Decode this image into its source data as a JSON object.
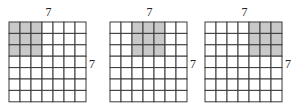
{
  "figures": [
    {
      "name": "grid-1",
      "rows": 7,
      "cols": 7,
      "top_label": "7",
      "side_label": "7",
      "shaded": {
        "row_start": 0,
        "row_end": 2,
        "col_start": 0,
        "col_end": 2
      }
    },
    {
      "name": "grid-2",
      "rows": 7,
      "cols": 7,
      "top_label": "7",
      "side_label": "7",
      "shaded": {
        "row_start": 0,
        "row_end": 2,
        "col_start": 2,
        "col_end": 4
      }
    },
    {
      "name": "grid-3",
      "rows": 7,
      "cols": 7,
      "top_label": "7",
      "side_label": "7",
      "shaded": {
        "row_start": 0,
        "row_end": 2,
        "col_start": 4,
        "col_end": 6
      }
    }
  ],
  "colors": {
    "shade": "#c9c9c9",
    "line": "#3a3a3a",
    "background": "#ffffff"
  }
}
